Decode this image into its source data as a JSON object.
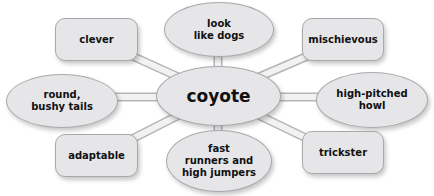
{
  "diagram": {
    "type": "concept-web",
    "colors": {
      "node_fill": "#e6e6e8",
      "node_border": "#a9a9ad",
      "connector_fill": "#f2f2f3",
      "connector_border": "#b5b5b8",
      "text": "#111111"
    },
    "center": {
      "label": "coyote"
    },
    "nodes": [
      {
        "id": "clever",
        "shape": "rounded-rect",
        "label": "clever"
      },
      {
        "id": "look-like-dogs",
        "shape": "ellipse",
        "label": "look\nlike dogs"
      },
      {
        "id": "mischievous",
        "shape": "rounded-rect",
        "label": "mischievous"
      },
      {
        "id": "round-bushy-tails",
        "shape": "ellipse",
        "label": "round,\nbushy tails"
      },
      {
        "id": "high-pitched-howl",
        "shape": "ellipse",
        "label": "high-pitched\nhowl"
      },
      {
        "id": "adaptable",
        "shape": "rounded-rect",
        "label": "adaptable"
      },
      {
        "id": "fast-runners",
        "shape": "ellipse",
        "label": "fast\nrunners and\nhigh jumpers"
      },
      {
        "id": "trickster",
        "shape": "rounded-rect",
        "label": "trickster"
      }
    ]
  }
}
